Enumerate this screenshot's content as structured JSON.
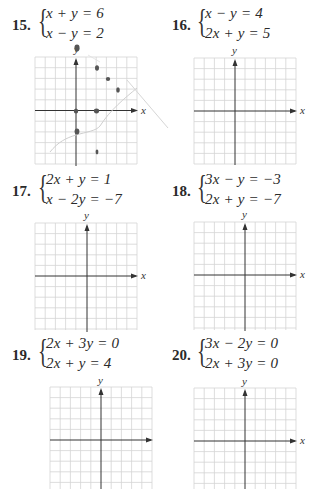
{
  "page": {
    "type": "textbook-exercise-page",
    "instructions_visible": false
  },
  "problems": [
    {
      "number": "15.",
      "equations": [
        "x + y = 6",
        "x − y = 2"
      ],
      "graph": {
        "x_label": "x",
        "y_label": "y",
        "grid_cells": 10,
        "has_pencil_marks": true
      }
    },
    {
      "number": "16.",
      "equations": [
        "x − y = 4",
        "2x + y = 5"
      ],
      "graph": {
        "x_label": "x",
        "y_label": "y",
        "grid_cells": 10,
        "has_pencil_marks": false
      }
    },
    {
      "number": "17.",
      "equations": [
        "2x + y = 1",
        "x − 2y = −7"
      ],
      "graph": {
        "x_label": "x",
        "y_label": "y",
        "grid_cells": 10,
        "has_pencil_marks": false
      }
    },
    {
      "number": "18.",
      "equations": [
        "3x − y = −3",
        "2x + y = −7"
      ],
      "graph": {
        "x_label": "x",
        "y_label": "y",
        "grid_cells": 10,
        "has_pencil_marks": false
      }
    },
    {
      "number": "19.",
      "equations": [
        "2x + 3y = 0",
        "2x + y = 4"
      ],
      "graph": {
        "x_label": "",
        "y_label": "y",
        "grid_cells": 10,
        "has_pencil_marks": false
      }
    },
    {
      "number": "20.",
      "equations": [
        "3x − 2y = 0",
        "2x + 3y = 0"
      ],
      "graph": {
        "x_label": "x",
        "y_label": "y",
        "grid_cells": 10,
        "has_pencil_marks": false
      }
    }
  ],
  "colors": {
    "grid": "#d4d4d4",
    "axis": "#333333",
    "pencil": "#555555",
    "pencil_line": "#c8c8c8"
  }
}
